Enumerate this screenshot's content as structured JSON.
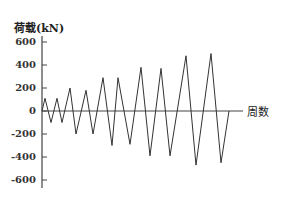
{
  "chart_data": {
    "type": "line",
    "title": "",
    "ylabel": "荷载(kN)",
    "xlabel": "周数",
    "ylim": [
      -650,
      650
    ],
    "yticks": [
      600,
      400,
      200,
      0,
      -200,
      -400,
      -600
    ],
    "ytick_labels": [
      "600",
      "400",
      "200",
      "0",
      "-200",
      "-400",
      "-600"
    ],
    "grid": false,
    "legend": null,
    "series": [
      {
        "name": "荷载",
        "description": "Cyclic load history with increasing amplitude (triangular waveform)",
        "x": [
          0,
          0.5,
          1,
          1.5,
          2,
          2.5,
          3,
          3.5,
          4,
          4.5,
          5,
          5.5,
          6,
          6.5,
          7,
          7.5,
          8,
          8.5,
          9,
          9.5,
          10,
          10.5
        ],
        "values": [
          0,
          110,
          -100,
          110,
          -100,
          200,
          -200,
          180,
          -200,
          290,
          -300,
          290,
          -290,
          380,
          -390,
          370,
          -390,
          480,
          -470,
          500,
          -450,
          0
        ]
      }
    ],
    "pixel_x": [
      42,
      45,
      51,
      57,
      62,
      70,
      76,
      86,
      93,
      103,
      112,
      118,
      130,
      141,
      150,
      161,
      170,
      186,
      196,
      211,
      221,
      229
    ]
  },
  "labels": {
    "ylabel": "荷载(kN)",
    "xlabel": "周数"
  }
}
